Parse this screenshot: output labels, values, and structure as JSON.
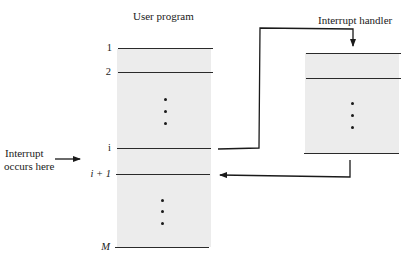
{
  "diagram": {
    "user_program": {
      "title": "User program",
      "markers": [
        {
          "label": "1",
          "italic": false
        },
        {
          "label": "2",
          "italic": false
        },
        {
          "label": "i",
          "italic": false
        },
        {
          "label": "i + 1",
          "italic": true
        },
        {
          "label": "M",
          "italic": true
        }
      ],
      "ellipsis_groups": 2
    },
    "interrupt_handler": {
      "title": "Interrupt handler",
      "ellipsis_groups": 1
    },
    "annotation": {
      "line1": "Interrupt",
      "line2": "occurs here"
    },
    "flows": [
      {
        "from": "annotation",
        "to": "user_program.i",
        "kind": "pointer-arrow"
      },
      {
        "from": "user_program.i",
        "to": "interrupt_handler.top",
        "kind": "transfer-control"
      },
      {
        "from": "interrupt_handler.bottom",
        "to": "user_program.i+1",
        "kind": "return-control"
      }
    ],
    "colors": {
      "box_fill": "#ececec",
      "line": "#2a2a2a",
      "background": "#ffffff"
    }
  }
}
